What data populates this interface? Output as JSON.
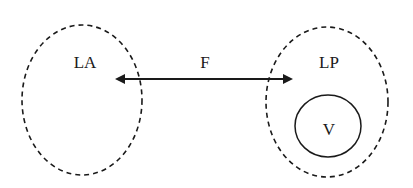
{
  "diagram": {
    "nodes": [
      {
        "id": "LA",
        "label": "LA",
        "shape": "dashed-ellipse"
      },
      {
        "id": "LP",
        "label": "LP",
        "shape": "dashed-ellipse"
      },
      {
        "id": "V",
        "label": "V",
        "shape": "solid-circle",
        "inside": "LP"
      }
    ],
    "edges": [
      {
        "from": "LA",
        "to": "LP",
        "label": "F",
        "direction": "bidirectional"
      }
    ],
    "colors": {
      "stroke": "#1a1a1a",
      "background": "#ffffff"
    }
  }
}
